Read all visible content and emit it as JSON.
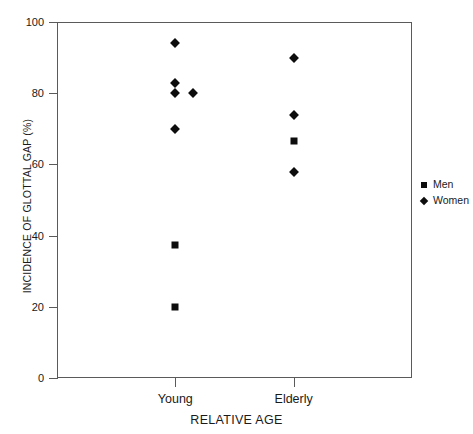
{
  "chart_data": {
    "type": "scatter",
    "title": "",
    "xlabel": "RELATIVE AGE",
    "ylabel": "INCIDENCE OF GLOTTAL GAP (%)",
    "categories": [
      "Young",
      "Elderly"
    ],
    "ylim": [
      0,
      100
    ],
    "yticks": [
      0,
      20,
      40,
      60,
      80,
      100
    ],
    "ytick_labels": [
      "0",
      "20",
      "40",
      "60",
      "80",
      "100"
    ],
    "grid": false,
    "legend_position": "right",
    "series": [
      {
        "name": "Men",
        "marker": "square",
        "color": "#0d0d0d",
        "points": [
          {
            "category": "Young",
            "x_offset": 0,
            "value": 37.5
          },
          {
            "category": "Young",
            "x_offset": 0,
            "value": 20
          },
          {
            "category": "Elderly",
            "x_offset": 0,
            "value": 66.5
          }
        ]
      },
      {
        "name": "Women",
        "marker": "diamond",
        "color": "#0d0d0d",
        "points": [
          {
            "category": "Young",
            "x_offset": 0,
            "value": 94
          },
          {
            "category": "Young",
            "x_offset": 0,
            "value": 83
          },
          {
            "category": "Young",
            "x_offset": 0,
            "value": 80
          },
          {
            "category": "Young",
            "x_offset": 18,
            "value": 80
          },
          {
            "category": "Young",
            "x_offset": 0,
            "value": 70
          },
          {
            "category": "Elderly",
            "x_offset": 0,
            "value": 90
          },
          {
            "category": "Elderly",
            "x_offset": 0,
            "value": 74
          },
          {
            "category": "Elderly",
            "x_offset": 0,
            "value": 58
          }
        ]
      }
    ]
  },
  "legend": {
    "items": [
      {
        "label": "Men",
        "marker": "square"
      },
      {
        "label": "Women",
        "marker": "diamond"
      }
    ]
  }
}
